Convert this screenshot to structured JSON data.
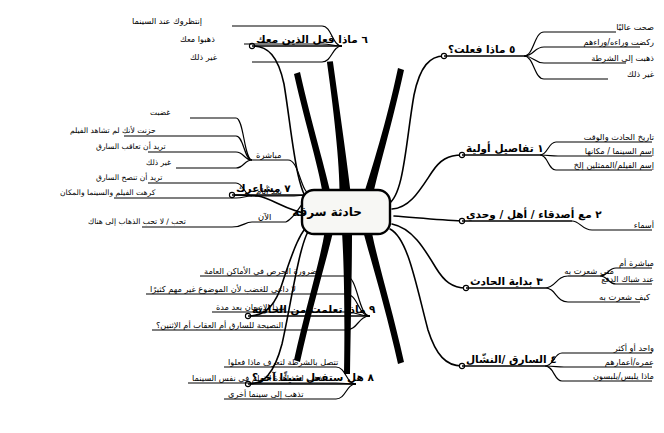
{
  "title": "حادثة سرقة",
  "center": {
    "label": "حادثة سرقة"
  },
  "branches": [
    {
      "number": "١",
      "label": "تفاصيل أولية",
      "side": "right",
      "children": [
        {
          "label": "تاريخ الحادث والوقت"
        },
        {
          "label": "إسم السينما / مكانها"
        },
        {
          "label": "إسم الفيلم/الممثلين إلخ"
        }
      ]
    },
    {
      "number": "٢",
      "label": "مع أصدقاء / أهل / وحدي",
      "side": "right",
      "children": [
        {
          "label": "أسماء"
        }
      ]
    },
    {
      "number": "٣",
      "label": "بداية الحادث",
      "side": "right",
      "children": [
        {
          "label": "متى شعرت به",
          "children": [
            {
              "label": "مباشرة أم"
            },
            {
              "label": "عند شباك الدفع"
            }
          ]
        },
        {
          "label": "كيف شعرت به"
        }
      ]
    },
    {
      "number": "٤",
      "label": "السارق /النشّال",
      "side": "right",
      "children": [
        {
          "label": "واحد أو أكثر"
        },
        {
          "label": "عمره/أعمارهم"
        },
        {
          "label": "ماذا يلبس/يلبسون"
        }
      ]
    },
    {
      "number": "٥",
      "label": "ماذا فعلت؟",
      "side": "right",
      "children": [
        {
          "label": "صحت عاليًا"
        },
        {
          "label": "ركضت وراءه/وراءهم"
        },
        {
          "label": "ذهبت إلى الشرطة"
        },
        {
          "label": "غير ذلك"
        }
      ]
    },
    {
      "number": "٦",
      "label": "ماذا فعل الذين معك",
      "side": "left",
      "children": [
        {
          "label": "إنتظروك عند السينما"
        },
        {
          "label": "ذهبوا معك"
        },
        {
          "label": "غير ذلك"
        }
      ]
    },
    {
      "number": "٧",
      "label": "مشاعرك",
      "side": "left",
      "children": [
        {
          "label": "مباشرة",
          "children": [
            {
              "label": "غضبت"
            },
            {
              "label": "حزنت لأنك لم تشاهد الفيلم"
            },
            {
              "label": "تريد أن تعاقب السارق"
            },
            {
              "label": "غير ذلك"
            }
          ]
        },
        {
          "label": "بعد أيام",
          "children": [
            {
              "label": "تريد أن تنصح السارق"
            },
            {
              "label": "كرهت الفيلم والسينما والمكان"
            }
          ]
        },
        {
          "label": "الآن",
          "children": [
            {
              "label": "تحب / لا تحب الذهاب إلى هناك"
            }
          ]
        }
      ]
    },
    {
      "number": "٨",
      "label": "هل ستفعل شيئًا آخر؟",
      "side": "left",
      "children": [
        {
          "label": "تتصل بالشرطة لتعرف ماذا فعلوا"
        },
        {
          "label": "تذهب لمشاهدة الفيلم في نفس السينما"
        },
        {
          "label": "تذهب إلى سينما أخرى"
        }
      ]
    },
    {
      "number": "٩",
      "label": "ماذا تعلمت من الحادثة",
      "side": "left",
      "children": [
        {
          "label": "ضرورة الحرص في الأماكن العامة"
        },
        {
          "label": "لا داعي للغضب لأن الموضوع غير مهم كثيرًا"
        },
        {
          "label": "يهدأ الإنسان بعد مدة"
        },
        {
          "label": "النصيحة للسارق أم العقاب أم الإثنين؟"
        }
      ]
    }
  ],
  "colors": {
    "ink": "#000000",
    "paper": "#ffffff"
  }
}
